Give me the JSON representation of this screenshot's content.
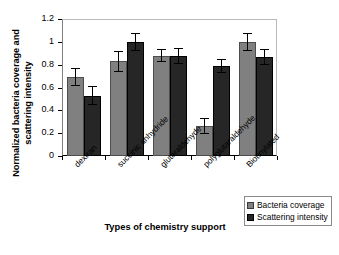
{
  "chart_data": {
    "type": "bar",
    "title": "",
    "xlabel": "Types of chemistry support",
    "ylabel_line1": "Normalized bacteria coverage and",
    "ylabel_line2": "scattering intensity",
    "categories": [
      "dextran",
      "succinic anhydride",
      "glutaraldehyde",
      "polyglutaraldehyde",
      "Biotinylated"
    ],
    "series": [
      {
        "name": "Bacteria coverage",
        "color": "#808080",
        "values": [
          0.69,
          0.83,
          0.88,
          0.26,
          1.0
        ],
        "errors": [
          0.08,
          0.09,
          0.06,
          0.07,
          0.08
        ]
      },
      {
        "name": "Scattering intensity",
        "color": "#262626",
        "values": [
          0.53,
          1.0,
          0.88,
          0.79,
          0.87
        ],
        "errors": [
          0.08,
          0.08,
          0.07,
          0.06,
          0.07
        ]
      }
    ],
    "ylim": [
      0,
      1.2
    ],
    "yticks": [
      0,
      0.2,
      0.4,
      0.6,
      0.8,
      1,
      1.2
    ],
    "ytick_labels": [
      "0",
      "0.2",
      "0.4",
      "0.6",
      "0.8",
      "1",
      "1.2"
    ],
    "grid": false,
    "legend_position": "bottom-right"
  },
  "legend": {
    "items": [
      {
        "label": "Bacteria coverage"
      },
      {
        "label": "Scattering intensity"
      }
    ]
  }
}
